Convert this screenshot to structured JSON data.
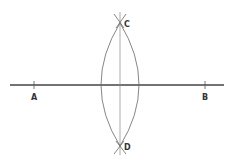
{
  "diagram": {
    "type": "perpendicular-bisector-construction",
    "colors": {
      "background": "#ffffff",
      "line": "#444444",
      "arc": "#666666",
      "label": "#333333"
    },
    "points": {
      "A": {
        "label": "A",
        "x": 34,
        "y": 85
      },
      "B": {
        "label": "B",
        "x": 205,
        "y": 85
      },
      "C": {
        "label": "C",
        "x": 120,
        "y": 23
      },
      "D": {
        "label": "D",
        "x": 120,
        "y": 146
      }
    },
    "segment_AB": {
      "x1": 10,
      "y1": 85,
      "x2": 224,
      "y2": 85
    },
    "bisector_CD": {
      "x1": 120,
      "y1": 12,
      "x2": 120,
      "y2": 155
    }
  }
}
